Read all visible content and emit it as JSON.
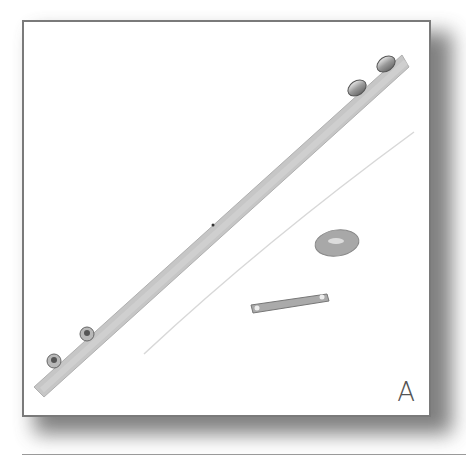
{
  "figure": {
    "label": "A",
    "parts": [
      "leather-strap",
      "snap-rivets",
      "round-bead",
      "id-bar-plate"
    ],
    "colors": {
      "frame_border": "#7a7a7a",
      "strap": "#c8c8c8",
      "metal": "#9a9a9a"
    }
  }
}
